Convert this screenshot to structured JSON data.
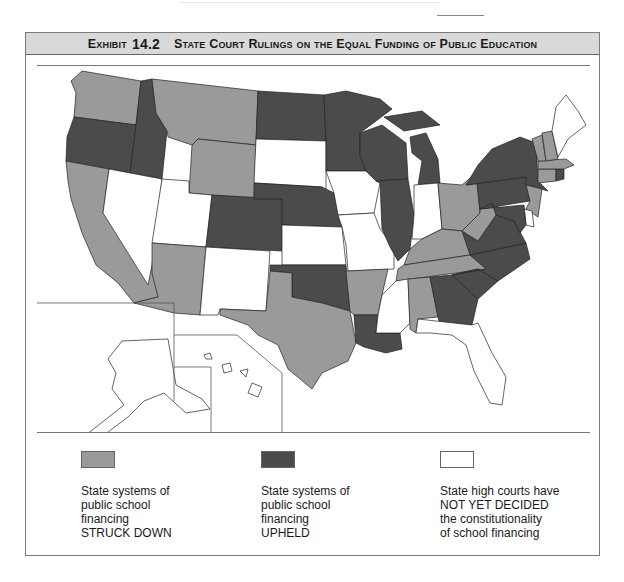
{
  "exhibit": {
    "label": "Exhibit",
    "number": "14.2",
    "title": "State Court Rulings on the Equal Funding of Public Education"
  },
  "colors": {
    "struck_down": "#9a9a9a",
    "upheld": "#4b4b4b",
    "not_decided": "#ffffff",
    "header_band": "#d9d9d9"
  },
  "map": {
    "states": {
      "WA": "struck_down",
      "OR": "upheld",
      "ID": "upheld",
      "MT": "struck_down",
      "WY": "struck_down",
      "CA": "struck_down",
      "NV": "not_decided",
      "UT": "not_decided",
      "AZ": "struck_down",
      "CO": "upheld",
      "NM": "not_decided",
      "ND": "upheld",
      "SD": "not_decided",
      "NE": "upheld",
      "KS": "not_decided",
      "OK": "upheld",
      "TX": "struck_down",
      "MN": "upheld",
      "IA": "not_decided",
      "MO": "not_decided",
      "AR": "struck_down",
      "LA": "upheld",
      "WI": "upheld",
      "IL": "upheld",
      "MI": "upheld",
      "IN": "not_decided",
      "OH": "struck_down",
      "KY": "struck_down",
      "TN": "struck_down",
      "MS": "not_decided",
      "AL": "struck_down",
      "GA": "upheld",
      "FL": "not_decided",
      "SC": "upheld",
      "NC": "upheld",
      "VA": "upheld",
      "WV": "struck_down",
      "PA": "upheld",
      "NY": "upheld",
      "NJ": "struck_down",
      "DE": "not_decided",
      "MD": "upheld",
      "CT": "struck_down",
      "RI": "upheld",
      "MA": "struck_down",
      "VT": "struck_down",
      "NH": "struck_down",
      "ME": "not_decided",
      "AK": "not_decided",
      "HI": "not_decided"
    }
  },
  "legend": [
    {
      "key": "struck_down",
      "lines": [
        "State systems of",
        "public school",
        "financing",
        "STRUCK DOWN"
      ]
    },
    {
      "key": "upheld",
      "lines": [
        "State systems of",
        "public school",
        "financing",
        "UPHELD"
      ]
    },
    {
      "key": "not_decided",
      "lines": [
        "State high courts have",
        "NOT YET DECIDED",
        "the constitutionality",
        "of school financing"
      ]
    }
  ]
}
